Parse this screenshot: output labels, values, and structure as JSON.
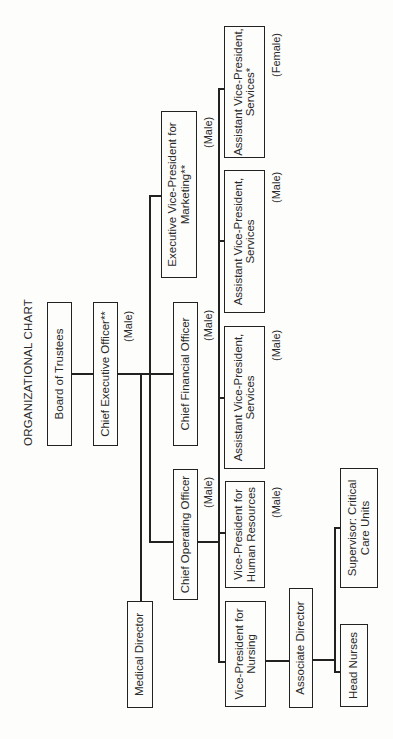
{
  "chart": {
    "title": "ORGANIZATIONAL CHART",
    "orientation": "rotated 90 degrees counter-clockwise"
  },
  "nodes": {
    "board": {
      "label": "Board of Trustees"
    },
    "ceo": {
      "label": "Chief Executive Officer**",
      "gender": "(Male)"
    },
    "cfo": {
      "label": "Chief Financial Officer",
      "gender": "(Male)"
    },
    "coo": {
      "label": "Chief Operating Officer",
      "gender": "(Male)"
    },
    "evp_marketing": {
      "line1": "Executive Vice-President for",
      "line2": "Marketing**",
      "gender": "(Male)"
    },
    "medical_director": {
      "label": "Medical Director"
    },
    "avp_services_female": {
      "line1": "Assistant Vice-President,",
      "line2": "Services*",
      "gender": "(Female)"
    },
    "avp_services_male_1": {
      "line1": "Assistant Vice-President,",
      "line2": "Services",
      "gender": "(Male)"
    },
    "avp_services_male_2": {
      "line1": "Assistant Vice-President,",
      "line2": "Services",
      "gender": "(Male)"
    },
    "vp_hr": {
      "line1": "Vice-President for",
      "line2": "Human Resources",
      "gender": "(Male)"
    },
    "vp_nursing": {
      "line1": "Vice-President for",
      "line2": "Nursing"
    },
    "associate_director": {
      "label": "Associate Director"
    },
    "supervisor_ccu": {
      "line1": "Supervisor: Critical",
      "line2": "Care Units"
    },
    "head_nurses": {
      "label": "Head Nurses"
    }
  },
  "hierarchy": [
    {
      "from": "Board of Trustees",
      "to": "Chief Executive Officer**"
    },
    {
      "from": "Chief Executive Officer**",
      "to": "Chief Financial Officer"
    },
    {
      "from": "Chief Executive Officer**",
      "to": "Medical Director"
    },
    {
      "from": "Chief Executive Officer**",
      "to": "Executive Vice-President for Marketing**"
    },
    {
      "from": "Chief Executive Officer**",
      "to": "Chief Operating Officer"
    },
    {
      "from": "Chief Operating Officer",
      "to": "Assistant Vice-President, Services* (Female)"
    },
    {
      "from": "Chief Operating Officer",
      "to": "Assistant Vice-President, Services (Male)"
    },
    {
      "from": "Chief Operating Officer",
      "to": "Assistant Vice-President, Services (Male)"
    },
    {
      "from": "Chief Operating Officer",
      "to": "Vice-President for Human Resources"
    },
    {
      "from": "Chief Operating Officer",
      "to": "Vice-President for Nursing"
    },
    {
      "from": "Vice-President for Nursing",
      "to": "Associate Director"
    },
    {
      "from": "Associate Director",
      "to": "Supervisor: Critical Care Units"
    },
    {
      "from": "Associate Director",
      "to": "Head Nurses"
    }
  ]
}
